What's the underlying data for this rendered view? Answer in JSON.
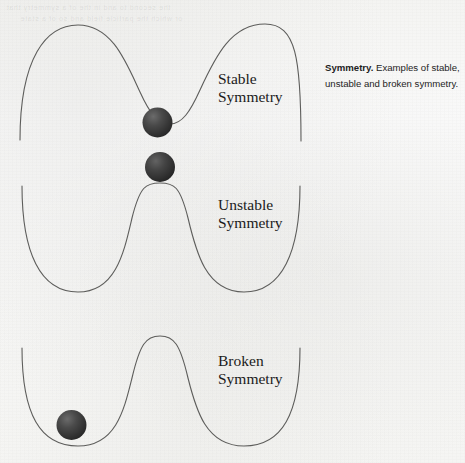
{
  "figure": {
    "background_color": "#f8f8f7",
    "curve_color": "#5a5a58",
    "ball_color": "#3a3a3a",
    "curves": [
      {
        "id": "stable",
        "label_line1": "Stable",
        "label_line2": "Symmetry",
        "shape": "single central valley",
        "ball_position": "bottom of valley (center)",
        "label_x": 218,
        "label_y": 70
      },
      {
        "id": "unstable",
        "label_line1": "Unstable",
        "label_line2": "Symmetry",
        "shape": "double well with central peak",
        "ball_position": "balanced on central peak",
        "label_x": 218,
        "label_y": 196
      },
      {
        "id": "broken",
        "label_line1": "Broken",
        "label_line2": "Symmetry",
        "shape": "double well with central peak",
        "ball_position": "resting in left well",
        "label_x": 218,
        "label_y": 352
      }
    ]
  },
  "caption": {
    "lead": "Symmetry.",
    "rest": " Examples of stable, unstable and broken symmetry."
  },
  "bleed_through": {
    "line1": "the second to and in the of a symmetry that",
    "line2": "or which the particle field and so of a state"
  }
}
